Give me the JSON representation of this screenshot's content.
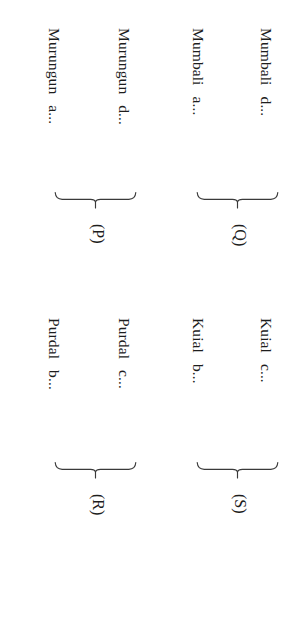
{
  "page": {
    "background_color": "#ffffff",
    "text_color": "#1d1d1d",
    "brace_color": "#3a3a3a",
    "orientation": "rotated-90-clockwise",
    "width": 284,
    "height": 638
  },
  "groups": [
    {
      "id": "P",
      "label": "(P)",
      "entries": [
        {
          "name": "Murungun",
          "tail": "a..."
        },
        {
          "name": "Murungun",
          "tail": "d..."
        }
      ]
    },
    {
      "id": "Q",
      "label": "(Q)",
      "entries": [
        {
          "name": "Mumbali",
          "tail": "a..."
        },
        {
          "name": "Mumbali",
          "tail": "d..."
        }
      ]
    },
    {
      "id": "R",
      "label": "(R)",
      "entries": [
        {
          "name": "Purdal",
          "tail": "b..."
        },
        {
          "name": "Purdal",
          "tail": "c..."
        }
      ]
    },
    {
      "id": "S",
      "label": "(S)",
      "entries": [
        {
          "name": "Kuial",
          "tail": "b..."
        },
        {
          "name": "Kuial",
          "tail": "c..."
        }
      ]
    }
  ]
}
